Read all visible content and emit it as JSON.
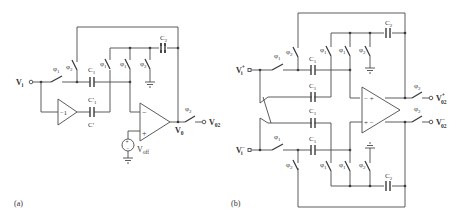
{
  "figure": {
    "panels": [
      {
        "id": "a",
        "caption": "(a)",
        "input_label": "V",
        "input_sub": "i",
        "output_label": "V",
        "output_sub": "02",
        "opamp_output_node": "V",
        "opamp_output_node_sub": "0",
        "offset_source_label": "V",
        "offset_source_sub": "off",
        "offset_source_plus": "+",
        "offset_source_minus": "−",
        "opamp_minus": "−",
        "opamp_plus": "+",
        "inverter_gain": "−1",
        "capacitors": {
          "c1": {
            "label": "C",
            "sub": "1"
          },
          "c1_prime": {
            "label": "C'",
            "sub": "1"
          },
          "c_prime": {
            "label": "C'"
          },
          "c2": {
            "label": "C",
            "sub": "2"
          }
        },
        "switches": {
          "input": {
            "phase": "φ",
            "sub": "1"
          },
          "feedback_top": {
            "phase": "φ",
            "sub": "2"
          },
          "mid_left": {
            "phase": "φ",
            "sub": "1"
          },
          "mid_right": {
            "phase": "φ",
            "sub": "1"
          },
          "ground": {
            "phase": "φ",
            "sub": "2"
          },
          "output": {
            "phase": "φ",
            "sub": "2"
          }
        }
      },
      {
        "id": "b",
        "caption": "(b)",
        "input_pos_label": "V",
        "input_pos_sub": "i",
        "input_pos_sup": "+",
        "input_neg_label": "V",
        "input_neg_sub": "i",
        "input_neg_sup": "−",
        "output_pos_label": "V",
        "output_pos_sub": "02",
        "output_pos_sup": "+",
        "output_neg_label": "V",
        "output_neg_sub": "02",
        "output_neg_sup": "−",
        "opamp_in_top": "− +",
        "opamp_in_bot": "+ −",
        "capacitors": {
          "c1_top": {
            "label": "C",
            "sub": "1"
          },
          "c1_cross_top": {
            "label": "C",
            "sub": "1"
          },
          "c1_cross_bot": {
            "label": "C",
            "sub": "1"
          },
          "c1_bot": {
            "label": "C",
            "sub": "1"
          },
          "c2_top": {
            "label": "C",
            "sub": "2"
          },
          "c2_bot": {
            "label": "C",
            "sub": "2"
          }
        },
        "switches": {
          "in_pos": {
            "phase": "φ",
            "sub": "1"
          },
          "in_neg": {
            "phase": "φ",
            "sub": "1"
          },
          "fb_top": {
            "phase": "φ",
            "sub": "2"
          },
          "fb_bot": {
            "phase": "φ",
            "sub": "2"
          },
          "mid_top_l": {
            "phase": "φ",
            "sub": "1"
          },
          "mid_top_r": {
            "phase": "φ",
            "sub": "1"
          },
          "gnd_top": {
            "phase": "φ",
            "sub": "2"
          },
          "mid_bot_l": {
            "phase": "φ",
            "sub": "1"
          },
          "mid_bot_r": {
            "phase": "φ",
            "sub": "1"
          },
          "gnd_bot": {
            "phase": "φ",
            "sub": "2"
          },
          "out_pos": {
            "phase": "φ",
            "sub": "2"
          },
          "out_neg": {
            "phase": "φ",
            "sub": "2"
          }
        }
      }
    ]
  }
}
